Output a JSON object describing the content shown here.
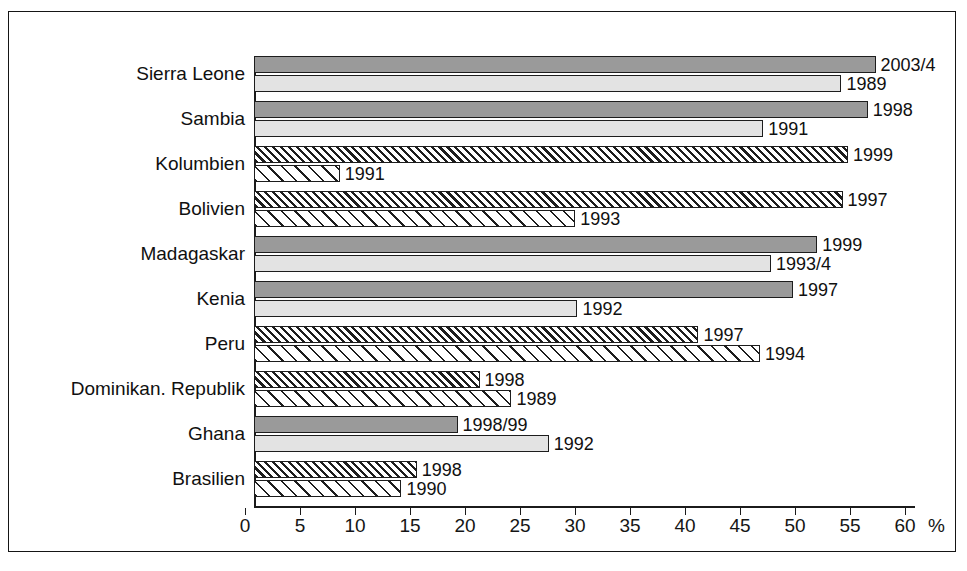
{
  "chart_data": {
    "type": "bar",
    "orientation": "horizontal",
    "title": "",
    "xlabel": "%",
    "ylabel": "",
    "xlim": [
      0,
      60
    ],
    "xticks": [
      "0",
      "5",
      "10",
      "15",
      "20",
      "25",
      "30",
      "35",
      "40",
      "45",
      "50",
      "55",
      "60"
    ],
    "xtick_values": [
      0,
      5,
      10,
      15,
      20,
      25,
      30,
      35,
      40,
      45,
      50,
      55,
      60
    ],
    "axis_unit": "%",
    "grid": false,
    "legend": "none",
    "categories": [
      "Sierra Leone",
      "Sambia",
      "Kolumbien",
      "Bolivien",
      "Madagaskar",
      "Kenia",
      "Peru",
      "Dominikan. Republik",
      "Ghana",
      "Brasilien"
    ],
    "series": [
      {
        "name": "neuer Erhebungszeitpunkt",
        "values": [
          56.5,
          55.8,
          54.0,
          53.5,
          51.2,
          49.0,
          40.4,
          20.5,
          18.5,
          14.8
        ],
        "labels": [
          "2003/4",
          "1998",
          "1999",
          "1997",
          "1999",
          "1997",
          "1997",
          "1998",
          "1998/99",
          "1998"
        ],
        "styles": [
          "solid-dark",
          "solid-dark",
          "hatch-dark",
          "hatch-dark",
          "solid-dark",
          "solid-dark",
          "hatch-dark",
          "hatch-dark",
          "solid-dark",
          "hatch-dark"
        ]
      },
      {
        "name": "frueherer Erhebungszeitpunkt",
        "values": [
          53.4,
          46.3,
          7.8,
          29.2,
          47.0,
          29.4,
          46.0,
          23.4,
          26.8,
          13.4
        ],
        "labels": [
          "1989",
          "1991",
          "1991",
          "1993",
          "1993/4",
          "1992",
          "1994",
          "1989",
          "1992",
          "1990"
        ],
        "styles": [
          "solid-light",
          "solid-light",
          "hatch-light",
          "hatch-light",
          "solid-light",
          "solid-light",
          "hatch-light",
          "hatch-light",
          "solid-light",
          "hatch-light"
        ]
      }
    ],
    "colors": {
      "solid_dark": "#9a9a9a",
      "solid_light": "#e3e3e3",
      "outline": "#1d1d1d",
      "frame": "#151515",
      "text": "#101010",
      "background": "#ffffff"
    }
  }
}
